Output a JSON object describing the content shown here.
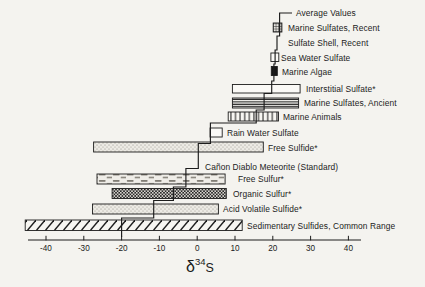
{
  "figure": {
    "background": "#f4f3ef",
    "ink": "#1c1c1c",
    "axis": {
      "label_delta": "δ",
      "label_mass_number": "34",
      "label_element": "S",
      "min": -40,
      "max": 40,
      "tick_step": 10,
      "tick_labels": [
        "-40",
        "-30",
        "-20",
        "-10",
        "0",
        "10",
        "20",
        "30",
        "40"
      ]
    }
  },
  "chart_data": {
    "type": "bar",
    "orientation": "horizontal-range",
    "title": "",
    "xlabel": "δ34S (per mil)",
    "xlim": [
      -40,
      40
    ],
    "grid": false,
    "legend": "none",
    "note": "Stepped vertical line connects the average value of each category; bars show the range of δ34S.",
    "rows": [
      {
        "label": "Average Values",
        "range": null,
        "average": 21.8,
        "pattern": "none"
      },
      {
        "label": "Marine Sulfates, Recent",
        "range": [
          20.1,
          22.4
        ],
        "average": 21.8,
        "pattern": "crosshatch"
      },
      {
        "label": "Sulfate Shell, Recent",
        "range": null,
        "average": 21.1,
        "pattern": "none"
      },
      {
        "label": "Sea Water Sulfate",
        "range": [
          19.5,
          21.6
        ],
        "average": 20.6,
        "pattern": "open"
      },
      {
        "label": "Marine Algae",
        "range": [
          19.6,
          21.2
        ],
        "average": 20.3,
        "pattern": "solid"
      },
      {
        "label": "Interstitial Sulfate*",
        "range": [
          9.3,
          27.2
        ],
        "average": 19.7,
        "pattern": "open"
      },
      {
        "label": "Marine Sulfates, Ancient",
        "range": [
          9.3,
          26.8
        ],
        "average": 17.7,
        "pattern": "hlines"
      },
      {
        "label": "Marine Animals",
        "range": [
          8.2,
          21.5
        ],
        "average": 15.6,
        "pattern": "vlines"
      },
      {
        "label": "Rain Water Sulfate",
        "range": [
          3.4,
          6.6
        ],
        "average": 3.5,
        "pattern": "open"
      },
      {
        "label": "Free Sulfide*",
        "range": [
          -27.4,
          17.5
        ],
        "average": 0.3,
        "pattern": "stipple"
      },
      {
        "label": "Cañon Diablo Meteorite (Standard)",
        "range": null,
        "average": 0,
        "pattern": "none"
      },
      {
        "label": "Free Sulfur*",
        "range": [
          -26.5,
          7.4
        ],
        "average": -3.0,
        "pattern": "dashes"
      },
      {
        "label": "Organic Sulfur*",
        "range": [
          -22.5,
          7.7
        ],
        "average": -6.3,
        "pattern": "checker"
      },
      {
        "label": "Acid Volatile Sulfide*",
        "range": [
          -27.7,
          5.6
        ],
        "average": -11.5,
        "pattern": "stipple"
      },
      {
        "label": "Sedimentary Sulfides, Common Range",
        "range": [
          -45.5,
          11.9
        ],
        "average": -20.0,
        "pattern": "diagonal"
      }
    ]
  }
}
